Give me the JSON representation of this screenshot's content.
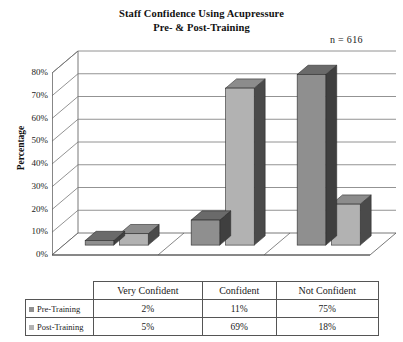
{
  "chart_data": {
    "type": "bar",
    "title": "Staff Confidence Using Acupressure Pre- & Post-Training",
    "title_line1": "Staff Confidence Using Acupressure",
    "title_line2": "Pre- & Post-Training",
    "annotation": "n = 616",
    "xlabel": "",
    "ylabel": "Percentage",
    "ylim": [
      0,
      80
    ],
    "ytick_labels": [
      "0%",
      "10%",
      "20%",
      "30%",
      "40%",
      "50%",
      "60%",
      "70%",
      "80%"
    ],
    "ytick_values": [
      0,
      10,
      20,
      30,
      40,
      50,
      60,
      70,
      80
    ],
    "grid": true,
    "legend_position": "table-left",
    "three_d": true,
    "categories": [
      "Very Confident",
      "Confident",
      "Not Confident"
    ],
    "series": [
      {
        "name": "Pre-Training",
        "values": [
          2,
          11,
          75
        ],
        "labels": [
          "2%",
          "11%",
          "75%"
        ],
        "color_front": "#8f8f8f",
        "color_side": "#3f3f3f",
        "color_top": "#6a6a6a"
      },
      {
        "name": "Post-Training",
        "values": [
          5,
          69,
          18
        ],
        "labels": [
          "5%",
          "69%",
          "18%"
        ],
        "color_front": "#b2b2b2",
        "color_side": "#4a4a4a",
        "color_top": "#8c8c8c"
      }
    ]
  },
  "table": {
    "column_headers": [
      "Very Confident",
      "Confident",
      "Not Confident"
    ],
    "rows": [
      {
        "label": "Pre-Training",
        "cells": [
          "2%",
          "11%",
          "75%"
        ]
      },
      {
        "label": "Post-Training",
        "cells": [
          "5%",
          "69%",
          "18%"
        ]
      }
    ]
  },
  "colors": {
    "axis": "#555555",
    "grid": "#777777",
    "text": "#1a1a1a",
    "background": "#ffffff"
  }
}
